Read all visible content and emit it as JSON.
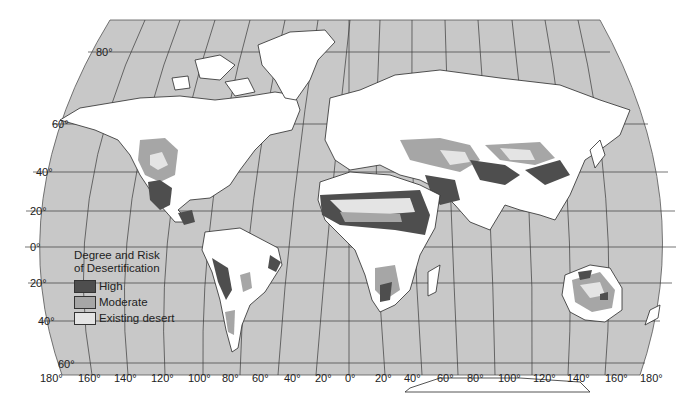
{
  "map": {
    "title": "Degree and Risk of Desertification",
    "projection": "world (Robinson-like)",
    "colors": {
      "ocean": "#c8c8c8",
      "land": "#ffffff",
      "high": "#4e4e4e",
      "moderate": "#a6a6a6",
      "existing_desert": "#e4e4e4",
      "gridlines": "#3a3a3a"
    },
    "legend": {
      "title_line1": "Degree and Risk",
      "title_line2": "of Desertification",
      "items": [
        {
          "label": "High",
          "color": "#4e4e4e"
        },
        {
          "label": "Moderate",
          "color": "#a6a6a6"
        },
        {
          "label": "Existing desert",
          "color": "#e4e4e4"
        }
      ]
    },
    "latitude_labels": [
      "80°",
      "60°",
      "40°",
      "20°",
      "0°",
      "20°",
      "40°",
      "60°"
    ],
    "longitude_labels": [
      "180°",
      "160°",
      "140°",
      "120°",
      "100°",
      "80°",
      "60°",
      "40°",
      "20°",
      "0°",
      "20°",
      "40°",
      "60°",
      "80°",
      "100°",
      "120°",
      "140°",
      "160°",
      "180°"
    ]
  }
}
